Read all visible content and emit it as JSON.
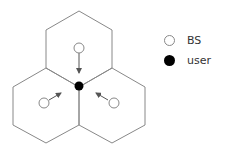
{
  "diagram": {
    "type": "hexagonal-cell-layout",
    "cells": 3,
    "colors": {
      "cell_line": "#888888",
      "bs_fill": "#ffffff",
      "user_fill": "#000000",
      "arrow": "#555555"
    },
    "nodes": [
      {
        "id": "bs-top",
        "kind": "BS"
      },
      {
        "id": "bs-left",
        "kind": "BS"
      },
      {
        "id": "bs-right",
        "kind": "BS"
      },
      {
        "id": "user-center",
        "kind": "user"
      }
    ],
    "edges": [
      {
        "from": "bs-top",
        "to": "user-center",
        "style": "arrow"
      },
      {
        "from": "bs-left",
        "to": "user-center",
        "style": "arrow"
      },
      {
        "from": "bs-right",
        "to": "user-center",
        "style": "arrow"
      }
    ]
  },
  "legend": {
    "items": [
      {
        "symbol": "open-circle",
        "label": "BS"
      },
      {
        "symbol": "filled-circle",
        "label": "user"
      }
    ]
  }
}
